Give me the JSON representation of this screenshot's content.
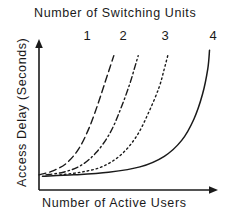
{
  "chart_data": {
    "type": "line",
    "title": "Number of Switching Units",
    "xlabel": "Number of Active Users",
    "ylabel": "Access Delay (Seconds)",
    "grid": false,
    "legend_position": "top",
    "axes_style": "arrow-axes-unlabeled-ticks",
    "xlim": [
      0,
      100
    ],
    "ylim": [
      0,
      100
    ],
    "annotations": [
      "1",
      "2",
      "3",
      "4"
    ],
    "series": [
      {
        "name": "1",
        "label": "1",
        "linestyle": "dashed",
        "color": "#1a1a1a",
        "x": [
          0,
          8,
          16,
          23,
          29,
          34,
          38,
          41,
          43
        ],
        "y": [
          2,
          5,
          11,
          22,
          38,
          56,
          72,
          84,
          92
        ]
      },
      {
        "name": "2",
        "label": "2",
        "linestyle": "dashdot",
        "color": "#1a1a1a",
        "x": [
          4,
          14,
          24,
          33,
          41,
          47,
          52,
          55,
          57
        ],
        "y": [
          2,
          4,
          9,
          19,
          34,
          52,
          70,
          83,
          92
        ]
      },
      {
        "name": "3",
        "label": "3",
        "linestyle": "dotted",
        "color": "#1a1a1a",
        "x": [
          12,
          24,
          36,
          47,
          56,
          63,
          69,
          72,
          74
        ],
        "y": [
          2,
          4,
          8,
          17,
          31,
          49,
          68,
          82,
          92
        ]
      },
      {
        "name": "4",
        "label": "4",
        "linestyle": "solid",
        "color": "#1a1a1a",
        "x": [
          2,
          20,
          40,
          58,
          72,
          82,
          89,
          94,
          97,
          98
        ],
        "y": [
          1,
          2,
          4,
          8,
          16,
          28,
          44,
          63,
          82,
          96
        ]
      }
    ],
    "curve_label_positions": [
      {
        "label": "1",
        "left": 79
      },
      {
        "label": "2",
        "left": 115
      },
      {
        "label": "3",
        "left": 157
      },
      {
        "label": "4",
        "left": 205
      }
    ]
  },
  "colors": {
    "ink": "#1a1a1a",
    "background": "#ffffff"
  }
}
